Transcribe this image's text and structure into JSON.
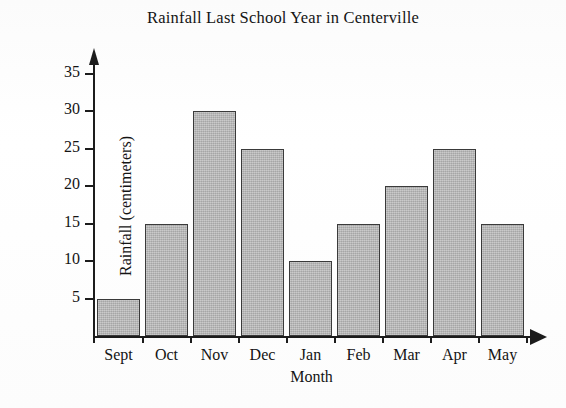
{
  "chart_data": {
    "type": "bar",
    "title": "Rainfall Last School Year in Centerville",
    "xlabel": "Month",
    "ylabel": "Rainfall (centimeters)",
    "categories": [
      "Sept",
      "Oct",
      "Nov",
      "Dec",
      "Jan",
      "Feb",
      "Mar",
      "Apr",
      "May"
    ],
    "values": [
      5,
      15,
      30,
      25,
      10,
      15,
      20,
      25,
      15
    ],
    "ytick_labels": [
      "5",
      "10",
      "15",
      "20",
      "25",
      "30",
      "35"
    ],
    "yticks": [
      5,
      10,
      15,
      20,
      25,
      30,
      35
    ],
    "ylim": [
      0,
      38
    ],
    "grid": false,
    "legend": "none",
    "bar_fill_color": "#b6b6b6",
    "bar_border_color": "#3a3a3a",
    "axis_color": "#1c1c1c",
    "background_color": "#fdfdfd"
  }
}
